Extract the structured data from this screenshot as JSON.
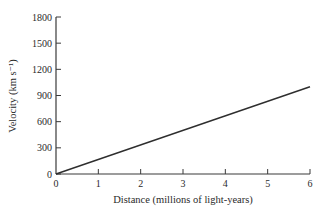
{
  "chart_data": {
    "type": "line",
    "title": "",
    "xlabel": "Distance (millions of light-years)",
    "ylabel": "Velocity (km s⁻¹)",
    "xlim": [
      0,
      6
    ],
    "ylim": [
      0,
      1800
    ],
    "x_ticks": [
      0,
      1,
      2,
      3,
      4,
      5,
      6
    ],
    "y_ticks": [
      0,
      300,
      600,
      900,
      1200,
      1500,
      1800
    ],
    "grid": false,
    "legend": null,
    "series": [
      {
        "name": "Hubble law",
        "x": [
          0,
          6
        ],
        "y": [
          0,
          1000
        ]
      }
    ]
  },
  "labels": {
    "xlabel": "Distance (millions of light-years)",
    "ylabel": "Velocity (km s⁻¹)"
  }
}
